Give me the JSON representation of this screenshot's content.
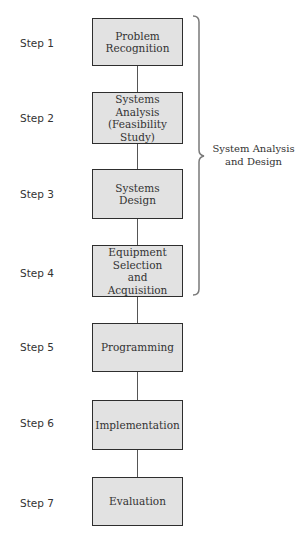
{
  "diagram": {
    "type": "flowchart",
    "steps": [
      {
        "label": "Step 1",
        "box": "Problem\nRecognition"
      },
      {
        "label": "Step 2",
        "box": "Systems\nAnalysis\n(Feasibility\nStudy)"
      },
      {
        "label": "Step 3",
        "box": "Systems\nDesign"
      },
      {
        "label": "Step 4",
        "box": "Equipment\nSelection\nand\nAcquisition"
      },
      {
        "label": "Step 5",
        "box": "Programming"
      },
      {
        "label": "Step 6",
        "box": "Implementation"
      },
      {
        "label": "Step 7",
        "box": "Evaluation"
      }
    ],
    "brace": {
      "label": "System Analysis\nand Design",
      "spans_steps": [
        1,
        2,
        3,
        4
      ]
    },
    "colors": {
      "box_fill": "#e2e2e2",
      "box_border": "#2e2e2e",
      "connector": "#555555",
      "brace": "#777777",
      "text": "#333333"
    }
  }
}
